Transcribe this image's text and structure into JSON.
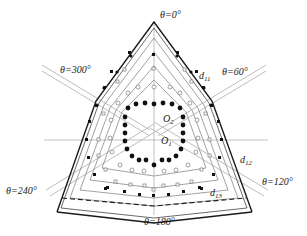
{
  "figure": {
    "type": "geometric-layout-diagram"
  },
  "angle_labels": [
    {
      "text": "θ=0°",
      "x": 160,
      "y": 18
    },
    {
      "text": "θ=60°",
      "x": 222,
      "y": 75
    },
    {
      "text": "θ=120°",
      "x": 262,
      "y": 185
    },
    {
      "text": "θ=180°",
      "x": 144,
      "y": 225
    },
    {
      "text": "θ=240°",
      "x": 6,
      "y": 194
    },
    {
      "text": "θ=300°",
      "x": 60,
      "y": 73
    }
  ],
  "dimension_labels": [
    {
      "main": "d",
      "sub": "11",
      "x": 199,
      "y": 79
    },
    {
      "main": "d",
      "sub": "12",
      "x": 240,
      "y": 163
    },
    {
      "main": "d",
      "sub": "13",
      "x": 210,
      "y": 196
    }
  ],
  "center_labels": [
    {
      "main": "O",
      "sub": "2",
      "x": 163,
      "y": 122
    },
    {
      "main": "O",
      "sub": "1",
      "x": 161,
      "y": 144
    }
  ],
  "colors": {
    "outline": "#1a1a1a",
    "inner_lines": "#8a8a8a",
    "guide_lines": "#b5b5b5",
    "markers": "#111111"
  }
}
